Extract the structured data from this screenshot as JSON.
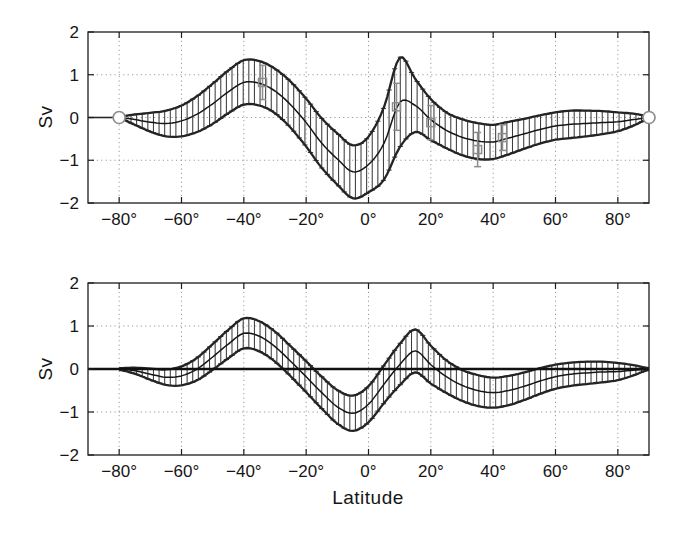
{
  "figure": {
    "xlabel": "Latitude",
    "ylabel": "Sv",
    "background": "#ffffff",
    "ink": "#1d1d1d",
    "bar_color": "#3c3c3c",
    "envelope_color": "#242424",
    "center_color": "#161616",
    "grid_color": "#9a9a9a",
    "overlay_gray": "#8d8d8d",
    "zero_line_color": "#111111",
    "xlim": [
      -90,
      90
    ],
    "ylim": [
      -2,
      2
    ],
    "x_ticks": [
      -80,
      -60,
      -40,
      -20,
      0,
      20,
      40,
      60,
      80
    ],
    "x_tick_labels": [
      "−80°",
      "−60°",
      "−40°",
      "−20°",
      "0°",
      "20°",
      "40°",
      "60°",
      "80°"
    ],
    "y_ticks": [
      2,
      1,
      0,
      -1,
      -2
    ],
    "y_tick_labels": [
      "2",
      "1",
      "0",
      "−1",
      "−2"
    ],
    "y_grid_lines": [
      1,
      0,
      -1
    ],
    "grid": true
  },
  "chart_data": [
    {
      "type": "line",
      "style": "errorbar-band",
      "panel": "top",
      "title": "",
      "xlabel": "Latitude",
      "ylabel": "Sv",
      "xlim": [
        -90,
        90
      ],
      "ylim": [
        -2,
        2
      ],
      "grid": true,
      "x": [
        -80,
        -75,
        -70,
        -65,
        -60,
        -55,
        -50,
        -45,
        -40,
        -35,
        -30,
        -25,
        -20,
        -15,
        -10,
        -5,
        0,
        5,
        10,
        15,
        20,
        25,
        30,
        35,
        40,
        45,
        50,
        55,
        60,
        65,
        70,
        75,
        80,
        85,
        90
      ],
      "center": [
        0,
        -0.05,
        -0.11,
        -0.14,
        -0.08,
        0.08,
        0.32,
        0.6,
        0.82,
        0.8,
        0.62,
        0.3,
        -0.12,
        -0.6,
        -0.97,
        -1.27,
        -1.1,
        -0.6,
        0.35,
        0.28,
        -0.05,
        -0.3,
        -0.46,
        -0.55,
        -0.57,
        -0.48,
        -0.38,
        -0.28,
        -0.2,
        -0.16,
        -0.14,
        -0.12,
        -0.1,
        -0.05,
        0
      ],
      "err": [
        0.02,
        0.12,
        0.22,
        0.3,
        0.36,
        0.42,
        0.47,
        0.5,
        0.52,
        0.52,
        0.52,
        0.54,
        0.56,
        0.58,
        0.6,
        0.62,
        0.65,
        0.85,
        1.05,
        0.62,
        0.48,
        0.42,
        0.42,
        0.42,
        0.4,
        0.38,
        0.35,
        0.33,
        0.32,
        0.32,
        0.3,
        0.27,
        0.22,
        0.14,
        0.03
      ],
      "endpoint_circle_markers": [
        {
          "x": -80,
          "y": 0
        },
        {
          "x": 90,
          "y": 0
        }
      ],
      "zero_segment_x": [
        -90,
        -80
      ],
      "overlay_square_points": [
        {
          "x": -34,
          "y": 0.82,
          "err": 0.4
        },
        {
          "x": 9,
          "y": 0.25,
          "err": 0.55
        },
        {
          "x": 20,
          "y": -0.12,
          "err": 0.4
        },
        {
          "x": 35,
          "y": -0.75,
          "err": 0.4
        },
        {
          "x": 43,
          "y": -0.47,
          "err": 0.3
        }
      ]
    },
    {
      "type": "line",
      "style": "errorbar-band",
      "panel": "bottom",
      "title": "",
      "xlabel": "Latitude",
      "ylabel": "Sv",
      "xlim": [
        -90,
        90
      ],
      "ylim": [
        -2,
        2
      ],
      "grid": true,
      "x": [
        -80,
        -75,
        -70,
        -65,
        -60,
        -55,
        -50,
        -45,
        -40,
        -35,
        -30,
        -25,
        -20,
        -15,
        -10,
        -5,
        0,
        5,
        10,
        15,
        20,
        25,
        30,
        35,
        40,
        45,
        50,
        55,
        60,
        65,
        70,
        75,
        80,
        85,
        90
      ],
      "center": [
        0,
        -0.04,
        -0.12,
        -0.19,
        -0.16,
        0,
        0.28,
        0.58,
        0.83,
        0.76,
        0.52,
        0.18,
        -0.18,
        -0.55,
        -0.88,
        -1.03,
        -0.82,
        -0.35,
        0.1,
        0.42,
        0.1,
        -0.18,
        -0.38,
        -0.5,
        -0.55,
        -0.5,
        -0.4,
        -0.28,
        -0.18,
        -0.12,
        -0.09,
        -0.07,
        -0.06,
        -0.03,
        0
      ],
      "err": [
        0.02,
        0.07,
        0.13,
        0.18,
        0.22,
        0.26,
        0.3,
        0.33,
        0.35,
        0.35,
        0.35,
        0.35,
        0.36,
        0.37,
        0.39,
        0.41,
        0.42,
        0.44,
        0.48,
        0.5,
        0.44,
        0.38,
        0.36,
        0.36,
        0.35,
        0.34,
        0.32,
        0.3,
        0.28,
        0.27,
        0.26,
        0.24,
        0.2,
        0.12,
        0.02
      ],
      "full_zero_line": true
    }
  ]
}
